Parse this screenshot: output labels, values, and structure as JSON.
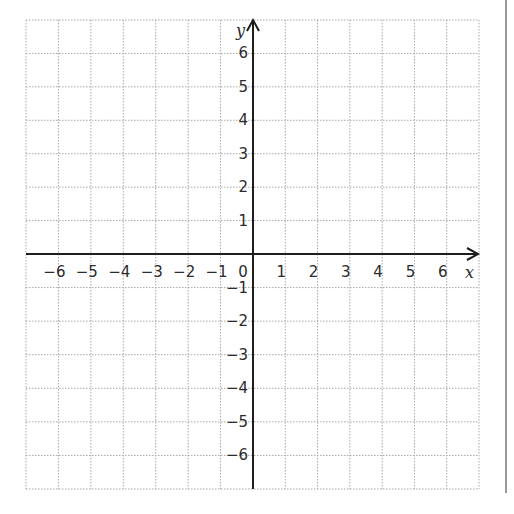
{
  "chart_data": {
    "type": "scatter",
    "title": "",
    "xlabel": "x",
    "ylabel": "y",
    "xlim": [
      -7,
      7
    ],
    "ylim": [
      -7,
      7
    ],
    "grid": true,
    "grid_style": "dotted",
    "x_ticks": [
      -6,
      -5,
      -4,
      -3,
      -2,
      -1,
      0,
      1,
      2,
      3,
      4,
      5,
      6
    ],
    "y_ticks": [
      -6,
      -5,
      -4,
      -3,
      -2,
      -1,
      1,
      2,
      3,
      4,
      5,
      6
    ],
    "x_tick_labels": [
      "−6",
      "−5",
      "−4",
      "−3",
      "−2",
      "−1",
      "0",
      "1",
      "2",
      "3",
      "4",
      "5",
      "6"
    ],
    "y_tick_labels": [
      "−6",
      "−5",
      "−4",
      "−3",
      "−2",
      "−1",
      "1",
      "2",
      "3",
      "4",
      "5",
      "6"
    ],
    "series": [],
    "origin_label": "0"
  },
  "axes": {
    "x_name": "x",
    "y_name": "y"
  },
  "colors": {
    "grid": "#a8a8a8",
    "axis": "#1e1e1e",
    "border": "#9a9a9a",
    "text": "#2b2b2b"
  }
}
